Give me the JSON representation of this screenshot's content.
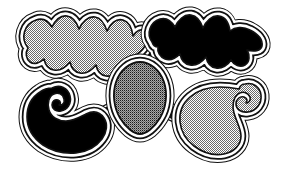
{
  "image": {
    "title": "Abstract organic blob contour illustration",
    "width": 281,
    "height": 182,
    "background_color": "#ffffff",
    "ink_color": "#000000",
    "style": "black-and-white line art with concentric contour bands and halftone fills",
    "shape_count": 5
  },
  "palette": {
    "background": "#ffffff",
    "outline": "#111111",
    "solid_fill": "#000000",
    "light_screen": "#c9c9c9",
    "dark_screen": "#6e6e6e",
    "band_white": "#ffffff"
  },
  "textures": [
    {
      "name": "light-dot-screen",
      "description": "fine checkerboard dot halftone, light",
      "approx_gray": "#c9c9c9",
      "cell_px": 2
    },
    {
      "name": "dark-dot-screen",
      "description": "fine checkerboard dot halftone, dense",
      "approx_gray": "#6e6e6e",
      "cell_px": 2
    },
    {
      "name": "solid-black",
      "description": "flat solid black fill",
      "approx_gray": "#000000",
      "cell_px": 0
    }
  ],
  "shapes": [
    {
      "id": "top-left-blob",
      "label": "Top left wavy blob",
      "position": "top-left",
      "fill": "light-dot-screen",
      "outline_bands": 3,
      "edge_motif": "scalloped sinusoidal waves along top and bottom",
      "bbox": [
        14,
        12,
        148,
        88
      ]
    },
    {
      "id": "top-right-blob",
      "label": "Top right black wavy blob",
      "position": "top-right",
      "fill": "solid-black",
      "outline_bands": 3,
      "edge_motif": "scalloped sinusoidal waves, tapered point at right",
      "bbox": [
        140,
        10,
        272,
        76
      ]
    },
    {
      "id": "center-shield-blob",
      "label": "Center shield blob",
      "position": "center",
      "fill": "dark-dot-screen",
      "outline_bands": 3,
      "edge_motif": "smooth leaf or shield outline with pointed base",
      "bbox": [
        108,
        58,
        172,
        136
      ]
    },
    {
      "id": "bottom-left-blob",
      "label": "Bottom left black hooked blob",
      "position": "bottom-left",
      "fill": "solid-black",
      "outline_bands": 3,
      "edge_motif": "spiral hook curl on the left side",
      "bbox": [
        18,
        80,
        112,
        166
      ]
    },
    {
      "id": "bottom-right-blob",
      "label": "Bottom right scrolled blob",
      "position": "bottom-right",
      "fill": "light-dot-screen",
      "outline_bands": 3,
      "edge_motif": "inward spiral scroll on the right side",
      "bbox": [
        168,
        76,
        270,
        168
      ]
    }
  ],
  "connectors": [
    {
      "id": "bridge-top-center",
      "label": "Bridge between top blobs and center shield",
      "from": "top-left-blob",
      "to": "center-shield-blob"
    },
    {
      "id": "bridge-left-center",
      "label": "Bridge between bottom left blob and center shield",
      "from": "bottom-left-blob",
      "to": "center-shield-blob"
    },
    {
      "id": "bridge-right-center",
      "label": "Bridge between center shield and bottom right blob",
      "from": "center-shield-blob",
      "to": "bottom-right-blob"
    }
  ]
}
